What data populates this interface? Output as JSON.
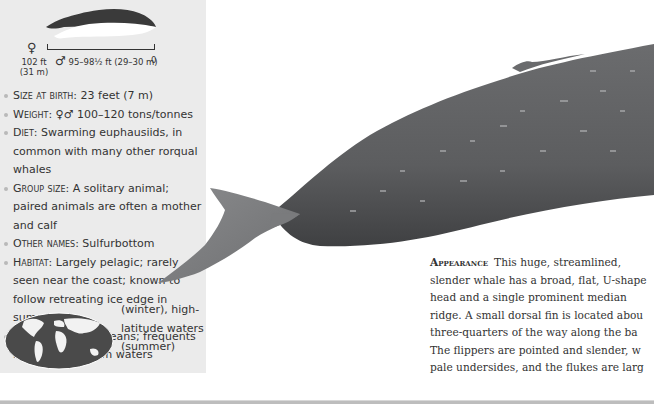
{
  "size_chart": {
    "female_symbol": "♀",
    "female_length_ft": "102 ft",
    "female_length_m": "(31 m)",
    "male_symbol": "♂",
    "male_length": "95–98½ ft (29–30 m)",
    "scale_zero": "0"
  },
  "facts": [
    {
      "label": "Size at birth",
      "value": ": 23 feet (7 m)"
    },
    {
      "label": "Weight",
      "value": ": ♀♂ 100–120 tons/tonnes"
    },
    {
      "label": "Diet",
      "value": ": Swarming euphausiids, in common with many other rorqual whales"
    },
    {
      "label": "Group size",
      "value": ": A solitary animal; paired animals are often a mother and calf"
    },
    {
      "label": "Other names",
      "value": ": Sulfurbottom"
    },
    {
      "label": "Habitat",
      "value": ": Largely pelagic; rarely seen near the coast; known to follow retreating ice edge in summer"
    },
    {
      "label": "Distribution",
      "value": ": All oceans; frequents low-latitude warm waters"
    }
  ],
  "distribution_continued": [
    "(winter), high-",
    "latitude waters",
    "(summer)"
  ],
  "map": {
    "icon": "world-map-icon"
  },
  "appearance": {
    "heading": "Appearance",
    "lines": [
      "This huge, streamlined,",
      "slender whale has a broad, flat, U-shape",
      "head and a single prominent median",
      "ridge. A small dorsal fin is located abou",
      "three-quarters of the way along the ba",
      "The flippers are pointed and slender, w",
      "pale undersides, and the flukes are larg"
    ]
  },
  "colors": {
    "panel_bg": "#ebebeb",
    "text": "#333333",
    "whale_body": "#5f6062",
    "whale_fluke": "#7d7e80"
  }
}
